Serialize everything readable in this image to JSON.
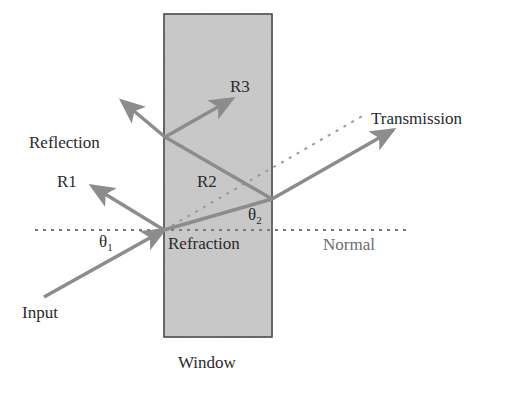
{
  "diagram": {
    "colors": {
      "window_fill": "#c9c9c9",
      "window_stroke": "#3a3a3a",
      "arrow": "#8c8c8c",
      "dotted": "#7a7a7a",
      "text": "#2a2a2a",
      "normal_text": "#6e6e6e"
    },
    "labels": {
      "r3": "R3",
      "transmission": "Transmission",
      "reflection": "Reflection",
      "r1": "R1",
      "r2": "R2",
      "theta": "θ",
      "theta2_sub": "2",
      "theta1_sub": "1",
      "refraction": "Refraction",
      "normal": "Normal",
      "input": "Input",
      "window": "Window"
    },
    "geometry": {
      "window_box": {
        "x": 164,
        "y": 14,
        "width": 108,
        "height": 323
      },
      "incidence_point": [
        164,
        230
      ],
      "exit_point": [
        272,
        199
      ],
      "second_reflection_point": [
        165,
        137
      ]
    }
  }
}
